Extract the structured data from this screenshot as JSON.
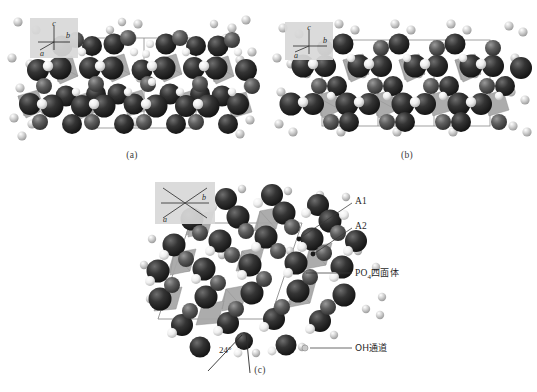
{
  "figure": {
    "background": "#ffffff"
  },
  "panels": [
    {
      "id": "a",
      "caption": "(a)",
      "axes": {
        "up": "c",
        "right": "b",
        "down_left": "a",
        "view": "projection along a-axis edge-on"
      },
      "cell": {
        "x": 92,
        "y": 38,
        "w": 104,
        "h": 90,
        "cols": 2,
        "rows": 1
      }
    },
    {
      "id": "b",
      "caption": "(b)",
      "axes": {
        "up": "c",
        "right": "b",
        "down_left": "a",
        "view": "projection along a-axis edge-on"
      },
      "cell": {
        "x": 322,
        "y": 40,
        "w": 168,
        "h": 86,
        "cols": 3,
        "rows": 1
      }
    },
    {
      "id": "c",
      "caption": "(c)",
      "axes": {
        "up": "",
        "right": "b",
        "down_left": "a",
        "view": "projection down c-axis"
      },
      "cell": {
        "x": 185,
        "y": 222,
        "w": 130,
        "h": 96
      }
    }
  ],
  "labels": {
    "a1": "A1",
    "a2": "A2",
    "po4": "PO4四面体",
    "po4_base": "PO",
    "po4_sub": "4",
    "po4_suffix": "四面体",
    "oh_channel": "OH通道",
    "angle": "24°"
  },
  "colors": {
    "atom_dark": "#2b2b2b",
    "atom_mid": "#585858",
    "atom_light": "#c9c9c9",
    "atom_white": "#f2f2f2",
    "tetrahedron": "#a8a8a8",
    "tetrahedron_dark": "#8d8d8d",
    "cell_line": "#8a8a8a",
    "axis_box": "#d9d9d9",
    "leader": "#3a3a3a",
    "background": "#ffffff"
  },
  "legend_items": [
    {
      "key": "a1",
      "label": "A1",
      "marker": "dark-sphere"
    },
    {
      "key": "a2",
      "label": "A2",
      "marker": "mid-sphere"
    },
    {
      "key": "po4",
      "label": "PO4四面体",
      "marker": "tetrahedron"
    },
    {
      "key": "oh",
      "label": "OH通道",
      "marker": "light-sphere"
    }
  ]
}
